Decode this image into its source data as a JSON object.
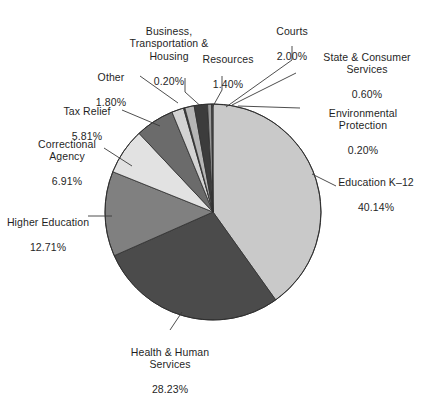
{
  "chart_data": {
    "type": "pie",
    "title": "",
    "subtitle": "",
    "xlabel": "",
    "ylabel": "",
    "legend_position": "none",
    "grid": false,
    "units": "percent",
    "start_angle_deg": 0,
    "direction": "clockwise",
    "categories": [
      "Education K–12",
      "Health & Human Services",
      "Higher Education",
      "Correctional Agency",
      "Tax Relief",
      "Other",
      "Business, Transportation & Housing",
      "Resources",
      "Courts",
      "State & Consumer Services",
      "Environmental Protection"
    ],
    "values": [
      40.14,
      28.23,
      12.71,
      6.91,
      5.81,
      1.8,
      0.2,
      1.4,
      2.0,
      0.6,
      0.2
    ],
    "value_labels": [
      "40.14%",
      "28.23%",
      "12.71%",
      "6.91%",
      "5.81%",
      "1.80%",
      "0.20%",
      "1.40%",
      "2.00%",
      "0.60%",
      "0.20%"
    ],
    "colors": [
      "#c9c9c9",
      "#4b4b4b",
      "#808080",
      "#e2e2e2",
      "#6b6b6b",
      "#d3d3d3",
      "#3f3f3f",
      "#b5b5b5",
      "#3c3c3c",
      "#9a9a9a",
      "#5a5a5a"
    ],
    "slices": [
      {
        "label": "Education K–12",
        "value": 40.14,
        "value_label": "40.14%",
        "color": "#c9c9c9"
      },
      {
        "label": "Health & Human Services",
        "value": 28.23,
        "value_label": "28.23%",
        "color": "#4b4b4b"
      },
      {
        "label": "Higher Education",
        "value": 12.71,
        "value_label": "12.71%",
        "color": "#808080"
      },
      {
        "label": "Correctional Agency",
        "value": 6.91,
        "value_label": "6.91%",
        "color": "#e2e2e2"
      },
      {
        "label": "Tax Relief",
        "value": 5.81,
        "value_label": "5.81%",
        "color": "#6b6b6b"
      },
      {
        "label": "Other",
        "value": 1.8,
        "value_label": "1.80%",
        "color": "#d3d3d3"
      },
      {
        "label": "Business, Transportation & Housing",
        "value": 0.2,
        "value_label": "0.20%",
        "color": "#3f3f3f"
      },
      {
        "label": "Resources",
        "value": 1.4,
        "value_label": "1.40%",
        "color": "#b5b5b5"
      },
      {
        "label": "Courts",
        "value": 2.0,
        "value_label": "2.00%",
        "color": "#3c3c3c"
      },
      {
        "label": "State & Consumer Services",
        "value": 0.6,
        "value_label": "0.60%",
        "color": "#9a9a9a"
      },
      {
        "label": "Environmental Protection",
        "value": 0.2,
        "value_label": "0.20%",
        "color": "#5a5a5a"
      }
    ]
  },
  "labels": {
    "business_transportation_housing": {
      "name": "Business,\nTransportation &\nHousing",
      "value": "0.20%"
    },
    "courts": {
      "name": "Courts",
      "value": "2.00%"
    },
    "resources": {
      "name": "Resources",
      "value": "1.40%"
    },
    "state_consumer_services": {
      "name": "State & Consumer\nServices",
      "value": "0.60%"
    },
    "environmental_protection": {
      "name": "Environmental\nProtection",
      "value": "0.20%"
    },
    "other": {
      "name": "Other",
      "value": "1.80%"
    },
    "tax_relief": {
      "name": "Tax Relief",
      "value": "5.81%"
    },
    "correctional_agency": {
      "name": "Correctional\nAgency",
      "value": "6.91%"
    },
    "higher_education": {
      "name": "Higher Education",
      "value": "12.71%"
    },
    "health_human_services": {
      "name": "Health & Human\nServices",
      "value": "28.23%"
    },
    "education_k12": {
      "name": "Education K–12",
      "value": "40.14%"
    }
  },
  "style": {
    "background": "#ffffff",
    "text_color": "#1f1f1f",
    "leader_color": "#3a3a3a",
    "slice_edge_color": "#2e2e2e"
  }
}
